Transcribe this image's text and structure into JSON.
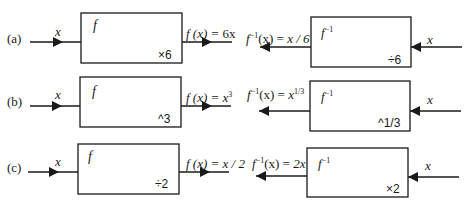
{
  "diagram": {
    "rows": [
      {
        "label": "(a)",
        "forward": {
          "input": "x",
          "box_name": "f",
          "operation": "×6",
          "output_lhs": "f (x) = ",
          "output_rhs": "6x"
        },
        "inverse": {
          "input": "x",
          "box_name": "f",
          "box_sup": "−1",
          "operation": "÷6",
          "output_lhs": "f",
          "output_sup": "−1",
          "output_mid": "(x) = ",
          "output_rhs": "x / 6"
        }
      },
      {
        "label": "(b)",
        "forward": {
          "input": "x",
          "box_name": "f",
          "operation": "^3",
          "output_lhs": "f (x) = ",
          "output_rhs": "x",
          "output_rhs_sup": "3"
        },
        "inverse": {
          "input": "x",
          "box_name": "f",
          "box_sup": "−1",
          "operation": "^1/3",
          "output_lhs": "f",
          "output_sup": "−1",
          "output_mid": "(x) = ",
          "output_rhs": "x",
          "output_rhs_sup": "1/3"
        }
      },
      {
        "label": "(c)",
        "forward": {
          "input": "x",
          "box_name": "f",
          "operation": "÷2",
          "output_lhs": "f (x) = ",
          "output_rhs": "x / 2"
        },
        "inverse": {
          "input": "x",
          "box_name": "f",
          "box_sup": "−1",
          "operation": "×2",
          "output_lhs": "f",
          "output_sup": "−1",
          "output_mid": "(x) = ",
          "output_rhs": "2x"
        }
      }
    ],
    "colors": {
      "stroke": "#1a1a1a",
      "background": "#ffffff"
    }
  }
}
